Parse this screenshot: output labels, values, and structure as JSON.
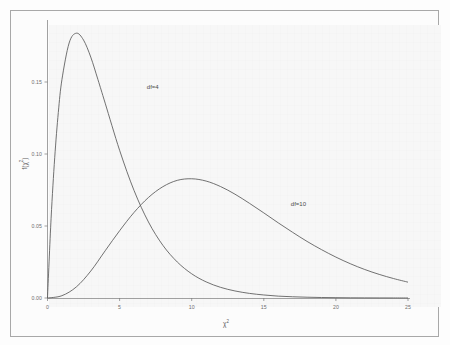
{
  "chart_data": {
    "type": "line",
    "title": "",
    "subtitle": "",
    "xlabel": "χ²",
    "ylabel": "f(χ²)",
    "xlim": [
      0,
      25
    ],
    "ylim": [
      0,
      0.19
    ],
    "grid": false,
    "legend_position": "inline-annotations",
    "xticks": [
      0,
      5,
      10,
      15,
      20,
      25
    ],
    "xtick_labels": [
      "0",
      "5",
      "10",
      "15",
      "20",
      "25"
    ],
    "yticks": [
      0.0,
      0.05,
      0.1,
      0.15
    ],
    "ytick_labels": [
      "0.00",
      "0.05",
      "0.10",
      "0.15"
    ],
    "annotations": [
      {
        "text": "df=4",
        "x": 7.3,
        "y": 0.1455
      },
      {
        "text": "df=10",
        "x": 17.4,
        "y": 0.0648
      }
    ],
    "series": [
      {
        "name": "df=4",
        "df": 4,
        "peak_x": 2.0,
        "peak_y": 0.1839,
        "x": [
          0,
          0.25,
          0.5,
          0.75,
          1,
          1.5,
          2,
          2.5,
          3,
          3.5,
          4,
          5,
          6,
          7,
          8,
          9,
          10,
          11,
          12,
          13,
          14,
          15,
          16,
          17,
          18,
          19,
          20,
          21,
          22,
          23,
          24,
          25
        ],
        "values": [
          0,
          0.0554,
          0.0974,
          0.1288,
          0.1516,
          0.1771,
          0.1839,
          0.1791,
          0.1673,
          0.1516,
          0.1353,
          0.1026,
          0.0747,
          0.0528,
          0.0366,
          0.025,
          0.0168,
          0.0112,
          0.0074,
          0.0049,
          0.0032,
          0.0021,
          0.0013,
          0.00085,
          0.00055,
          0.00035,
          0.00023,
          0.00014,
          9e-05,
          6e-05,
          4e-05,
          2e-05
        ]
      },
      {
        "name": "df=10",
        "df": 10,
        "peak_x": 8.0,
        "peak_y": 0.0977,
        "x": [
          0,
          1,
          2,
          3,
          4,
          5,
          6,
          7,
          8,
          9,
          10,
          11,
          12,
          13,
          14,
          15,
          16,
          17,
          18,
          19,
          20,
          21,
          22,
          23,
          24,
          25
        ],
        "values": [
          0,
          0.0016,
          0.0077,
          0.0187,
          0.0328,
          0.0467,
          0.0594,
          0.0698,
          0.0773,
          0.0817,
          0.0828,
          0.0812,
          0.0774,
          0.0721,
          0.0658,
          0.0591,
          0.0522,
          0.0456,
          0.0393,
          0.0336,
          0.0284,
          0.0238,
          0.0198,
          0.0164,
          0.0135,
          0.011
        ]
      }
    ]
  },
  "style": {
    "curve_color": "#595959",
    "axis_color": "#6e6e6e",
    "frame_color": "#a8a8a8",
    "panel_background": "#f7f7f7",
    "figure_background": "#fdfdfd",
    "tick_label_color": "#6e6e6e"
  }
}
